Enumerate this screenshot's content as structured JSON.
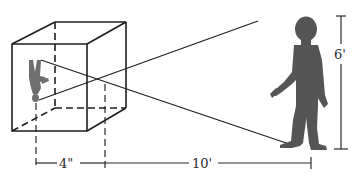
{
  "diagram": {
    "type": "pinhole-camera",
    "colors": {
      "line": "#1e1e1e",
      "silhouette": "#555555",
      "image_silhouette": "#6e6e6e",
      "background": "#ffffff"
    },
    "labels": {
      "image_distance": "4\"",
      "object_distance": "10'",
      "object_height": "6'"
    },
    "elements": {
      "box": "pinhole camera box (cube, dashed hidden edges)",
      "object": "standing person silhouette",
      "image": "inverted person silhouette on back wall",
      "rays": "two straight rays crossing at the pinhole"
    }
  }
}
